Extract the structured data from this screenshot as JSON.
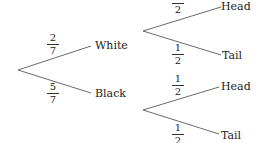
{
  "tree": {
    "first_stage": [
      {
        "label": "White",
        "prob_num": "2",
        "prob_den": "7"
      },
      {
        "label": "Black",
        "prob_num": "5",
        "prob_den": "7"
      }
    ],
    "second_stage_upper": [
      {
        "label": "Head",
        "prob_num": "1",
        "prob_den": "2"
      },
      {
        "label": "Tail",
        "prob_num": "1",
        "prob_den": "2"
      }
    ],
    "second_stage_lower": [
      {
        "label": "Head",
        "prob_num": "1",
        "prob_den": "2"
      },
      {
        "label": "Tail",
        "prob_num": "1",
        "prob_den": "2"
      }
    ]
  },
  "colors": {
    "line": "#6a6a6a",
    "text": "#222222"
  }
}
